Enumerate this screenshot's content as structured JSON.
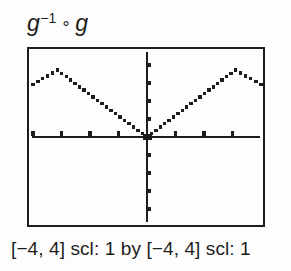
{
  "window": {
    "background": "#fdfdfd",
    "ink": "#1d1d1d"
  },
  "title": {
    "text": "g⁻¹ ∘ g",
    "g1": "g",
    "sup": "−1",
    "op": "∘",
    "g2": "g"
  },
  "caption": {
    "text": "[−4, 4] scl: 1 by [−4, 4] scl: 1"
  },
  "chart_data": {
    "type": "line",
    "subtitle": "",
    "xlabel": "",
    "ylabel": "",
    "xlim": [
      -4,
      4
    ],
    "ylim": [
      -4,
      4
    ],
    "xscl": 1,
    "yscl": 1,
    "grid": false,
    "legend": "none",
    "style": "graphing-calculator pixel dots, axes with tick marks, no numeric labels",
    "series": [
      {
        "name": "g-inverse composed with g",
        "points_xy": [
          [
            -4,
            2.35
          ],
          [
            -3.15,
            3
          ],
          [
            0,
            0
          ],
          [
            3.1,
            3
          ],
          [
            4,
            2.35
          ]
        ],
        "shape_note": "V of y=|x| from (0,0) up to peaks near x=±3, then folding back down toward the screen edges; heavy dot at the origin"
      }
    ],
    "caption": "[−4, 4] scl: 1 by [−4, 4] scl: 1"
  }
}
